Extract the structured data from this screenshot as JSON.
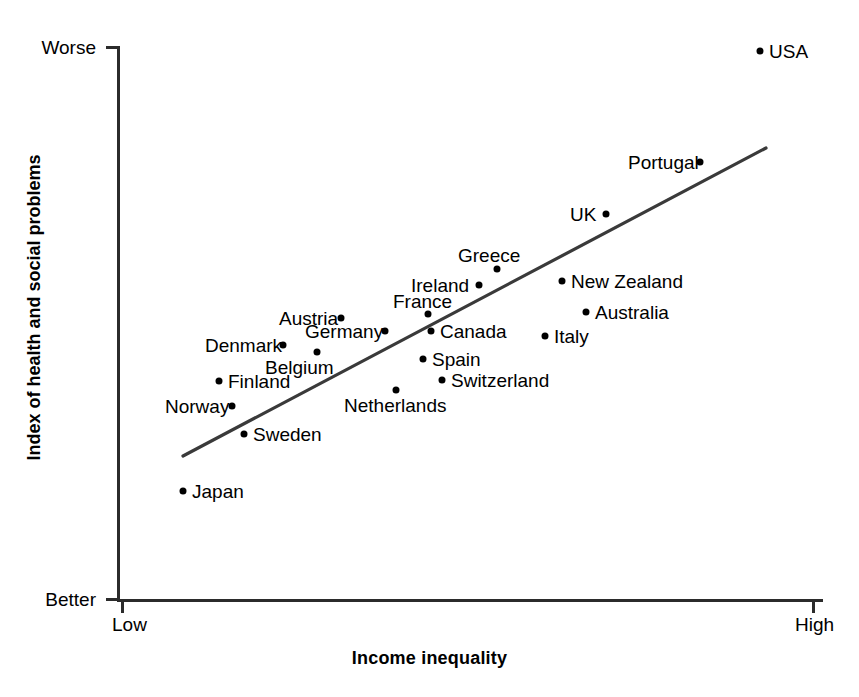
{
  "chart_data": {
    "type": "scatter",
    "title": "",
    "xlabel": "Income inequality",
    "ylabel": "Index of health and social problems",
    "x_tick_labels": [
      "Low",
      "High"
    ],
    "y_tick_labels": [
      "Worse",
      "Better"
    ],
    "grid": false,
    "legend": "none",
    "axis_direction_note": "y increases upward toward Worse; x increases rightward toward High",
    "xlim": [
      0,
      100
    ],
    "ylim": [
      0,
      100
    ],
    "points": [
      {
        "name": "USA",
        "x": 91.0,
        "y": 99.1,
        "label_side": "right",
        "dot_px": [
          760,
          51
        ],
        "label_px": [
          769,
          42
        ]
      },
      {
        "name": "Portugal",
        "x": 82.6,
        "y": 78.9,
        "label_side": "left",
        "dot_px": [
          700,
          162
        ],
        "label_px": [
          628,
          153
        ]
      },
      {
        "name": "UK",
        "x": 69.3,
        "y": 69.4,
        "label_side": "left",
        "dot_px": [
          606,
          214
        ],
        "label_px": [
          570,
          205
        ]
      },
      {
        "name": "Greece",
        "x": 53.8,
        "y": 59.9,
        "label_side": "above",
        "dot_px": [
          497,
          269
        ],
        "label_px": [
          458,
          246
        ]
      },
      {
        "name": "Ireland",
        "x": 51.3,
        "y": 57.0,
        "label_side": "left",
        "dot_px": [
          479,
          285
        ],
        "label_px": [
          411,
          276
        ]
      },
      {
        "name": "New Zealand",
        "x": 63.0,
        "y": 57.3,
        "label_side": "right",
        "dot_px": [
          562,
          281
        ],
        "label_px": [
          571,
          272
        ]
      },
      {
        "name": "France",
        "x": 44.1,
        "y": 51.6,
        "label_side": "above",
        "dot_px": [
          428,
          314
        ],
        "label_px": [
          393,
          292
        ]
      },
      {
        "name": "Australia",
        "x": 66.4,
        "y": 51.9,
        "label_side": "right",
        "dot_px": [
          586,
          312
        ],
        "label_px": [
          595,
          303
        ]
      },
      {
        "name": "Austria",
        "x": 31.7,
        "y": 50.7,
        "label_side": "left",
        "dot_px": [
          341,
          318
        ],
        "label_px": [
          279,
          309
        ]
      },
      {
        "name": "Germany",
        "x": 37.9,
        "y": 48.4,
        "label_side": "left",
        "dot_px": [
          385,
          331
        ],
        "label_px": [
          305,
          322
        ]
      },
      {
        "name": "Canada",
        "x": 44.5,
        "y": 48.4,
        "label_side": "right",
        "dot_px": [
          431,
          331
        ],
        "label_px": [
          440,
          322
        ]
      },
      {
        "name": "Denmark",
        "x": 23.4,
        "y": 45.9,
        "label_side": "left",
        "dot_px": [
          283,
          345
        ],
        "label_px": [
          205,
          336
        ]
      },
      {
        "name": "Italy",
        "x": 60.6,
        "y": 47.5,
        "label_side": "right",
        "dot_px": [
          545,
          336
        ],
        "label_px": [
          554,
          327
        ]
      },
      {
        "name": "Belgium",
        "x": 28.3,
        "y": 44.6,
        "label_side": "below",
        "dot_px": [
          317,
          352
        ],
        "label_px": [
          265,
          358
        ]
      },
      {
        "name": "Spain",
        "x": 43.3,
        "y": 43.3,
        "label_side": "right",
        "dot_px": [
          423,
          359
        ],
        "label_px": [
          432,
          350
        ]
      },
      {
        "name": "Switzerland",
        "x": 46.0,
        "y": 39.6,
        "label_side": "right",
        "dot_px": [
          442,
          380
        ],
        "label_px": [
          451,
          371
        ]
      },
      {
        "name": "Finland",
        "x": 14.4,
        "y": 39.4,
        "label_side": "right",
        "dot_px": [
          219,
          381
        ],
        "label_px": [
          228,
          372
        ]
      },
      {
        "name": "Netherlands",
        "x": 39.5,
        "y": 37.7,
        "label_side": "below",
        "dot_px": [
          396,
          390
        ],
        "label_px": [
          344,
          396
        ]
      },
      {
        "name": "Norway",
        "x": 16.3,
        "y": 34.9,
        "label_side": "left",
        "dot_px": [
          232,
          406
        ],
        "label_px": [
          165,
          397
        ]
      },
      {
        "name": "Sweden",
        "x": 18.0,
        "y": 29.9,
        "label_side": "right",
        "dot_px": [
          244,
          434
        ],
        "label_px": [
          253,
          425
        ]
      },
      {
        "name": "Japan",
        "x": 9.3,
        "y": 19.6,
        "label_side": "right",
        "dot_px": [
          183,
          491
        ],
        "label_px": [
          192,
          482
        ]
      }
    ],
    "trend_line": {
      "style": "solid",
      "color": "#3a3a3a",
      "start_px": [
        183,
        456
      ],
      "end_px": [
        766,
        148
      ]
    }
  },
  "axes": {
    "y_top_label": "Worse",
    "y_bottom_label": "Better",
    "x_left_label": "Low",
    "x_right_label": "High",
    "x_title": "Income inequality",
    "y_title": "Index of health and social problems"
  },
  "colors": {
    "axis": "#2b2b2b",
    "point": "#000000",
    "trend": "#3a3a3a",
    "background": "#ffffff",
    "text": "#000000"
  }
}
